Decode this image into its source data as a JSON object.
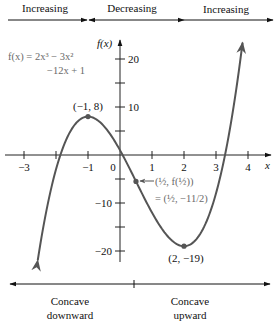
{
  "function": {
    "label_line1": "f(x) = 2x³ − 3x²",
    "label_line2": "−12x + 1",
    "coefficients": [
      2,
      -3,
      -12,
      1
    ],
    "curve_color": "#555555",
    "x_start": -2.57,
    "x_end": 3.83
  },
  "axes": {
    "x_label": "x",
    "y_label": "f(x)",
    "x_ticks": [
      {
        "value": -3,
        "label": "−3"
      },
      {
        "value": -2,
        "label": ""
      },
      {
        "value": -1,
        "label": "−1"
      },
      {
        "value": 0,
        "label": "0"
      },
      {
        "value": 1,
        "label": "1"
      },
      {
        "value": 2,
        "label": "2"
      },
      {
        "value": 3,
        "label": "3"
      },
      {
        "value": 4,
        "label": "4"
      }
    ],
    "y_ticks": [
      {
        "value": 20,
        "label": "20"
      },
      {
        "value": 15,
        "label": ""
      },
      {
        "value": 10,
        "label": "10"
      },
      {
        "value": 5,
        "label": ""
      },
      {
        "value": -5,
        "label": ""
      },
      {
        "value": -10,
        "label": "−10"
      },
      {
        "value": -15,
        "label": ""
      },
      {
        "value": -20,
        "label": "−20"
      }
    ]
  },
  "points": {
    "local_max": {
      "x": -1,
      "y": 8,
      "label": "(−1, 8)"
    },
    "local_min": {
      "x": 2,
      "y": -19,
      "label": "(2, −19)"
    },
    "inflection": {
      "x": 0.5,
      "y": -5.5,
      "label_line1": "(½, f(½))",
      "label_line2": "= (½, −11/2)"
    }
  },
  "monotonicity": {
    "intervals": [
      {
        "label": "Increasing",
        "from": null,
        "to": -1
      },
      {
        "label": "Decreasing",
        "from": -1,
        "to": 2
      },
      {
        "label": "Increasing",
        "from": 2,
        "to": null
      }
    ]
  },
  "concavity": {
    "split_x": 0.5,
    "left_line1": "Concave",
    "left_line2": "downward",
    "right_line1": "Concave",
    "right_line2": "upward"
  }
}
